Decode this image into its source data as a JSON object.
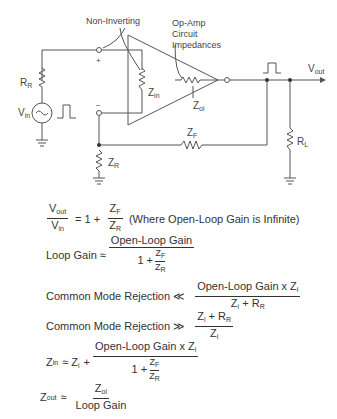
{
  "circuit": {
    "labels": {
      "non_inverting": "Non-Inverting",
      "op_amp_line1": "Op-Amp",
      "op_amp_line2": "Circuit",
      "op_amp_line3": "Impedances",
      "plus": "+",
      "minus": "−",
      "r_r": "R",
      "r_r_sub": "R",
      "v_in": "V",
      "v_in_sub": "in",
      "z_in": "Z",
      "z_in_sub": "in",
      "z_oi": "Z",
      "z_oi_sub": "oi",
      "z_f": "Z",
      "z_f_sub": "F",
      "z_r": "Z",
      "z_r_sub": "R",
      "v_out": "V",
      "v_out_sub": "out",
      "r_l": "R",
      "r_l_sub": "L"
    }
  },
  "equations": {
    "eq1": {
      "num": "V",
      "num_sub": "out",
      "den": "V",
      "den_sub": "in",
      "rhs_prefix": "= 1 +",
      "f_num": "Z",
      "f_num_sub": "F",
      "f_den": "Z",
      "f_den_sub": "R",
      "note": "(Where Open-Loop Gain is Infinite)"
    },
    "eq2": {
      "lhs": "Loop Gain ≈",
      "num": "Open-Loop Gain",
      "den_prefix": "1 +",
      "f_num": "Z",
      "f_num_sub": "F",
      "f_den": "Z",
      "f_den_sub": "R"
    },
    "eq3": {
      "lhs": "Common Mode Rejection ≪",
      "num": "Open-Loop Gain x Z",
      "num_sub": "i",
      "den": "Z",
      "den_sub": "i",
      "den_suffix": " + R",
      "den_suffix_sub": "R"
    },
    "eq4": {
      "lhs": "Common Mode Rejection ≫",
      "num": "Z",
      "num_sub": "i",
      "num_suffix": " + R",
      "num_suffix_sub": "R",
      "den": "Z",
      "den_sub": "i"
    },
    "eq5": {
      "lhs": "Z",
      "lhs_sub": "in",
      "lhs_rel": "≈ Z",
      "lhs_rel_sub": "i",
      "plus": "+",
      "num": "Open-Loop Gain x Z",
      "num_sub": "i",
      "den_prefix": "1 +",
      "f_num": "Z",
      "f_num_sub": "F",
      "f_den": "Z",
      "f_den_sub": "R"
    },
    "eq6": {
      "lhs": "Z",
      "lhs_sub": "out",
      "rel": "≈",
      "num": "Z",
      "num_sub": "oi",
      "den": "Loop Gain"
    }
  }
}
